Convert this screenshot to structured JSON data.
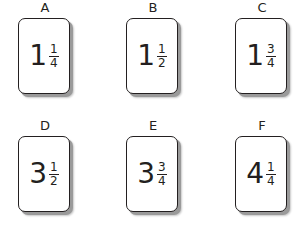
{
  "cards": [
    {
      "label": "A",
      "whole": "1",
      "numerator": "1",
      "denominator": "4"
    },
    {
      "label": "B",
      "whole": "1",
      "numerator": "1",
      "denominator": "2"
    },
    {
      "label": "C",
      "whole": "1",
      "numerator": "3",
      "denominator": "4"
    },
    {
      "label": "D",
      "whole": "3",
      "numerator": "1",
      "denominator": "2"
    },
    {
      "label": "E",
      "whole": "3",
      "numerator": "3",
      "denominator": "4"
    },
    {
      "label": "F",
      "whole": "4",
      "numerator": "1",
      "denominator": "4"
    }
  ],
  "colors": {
    "ink": "#231f20",
    "shadow": "#9a9a9a",
    "card_fill": "#ffffff"
  }
}
